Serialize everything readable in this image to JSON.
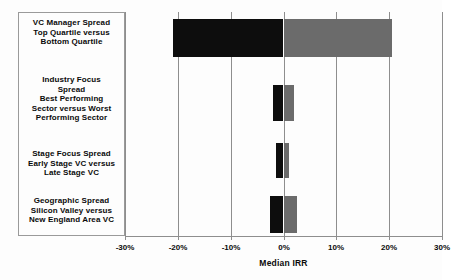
{
  "chart_data": {
    "type": "bar",
    "orientation": "horizontal",
    "title": "",
    "xlabel": "Median IRR",
    "ylabel": "",
    "xlim": [
      -30,
      30
    ],
    "xticks": [
      -30,
      -20,
      -10,
      0,
      10,
      20,
      30
    ],
    "xtick_labels": [
      "-30%",
      "-20%",
      "-10%",
      "0%",
      "10%",
      "20%",
      "30%"
    ],
    "grid": true,
    "legend": false,
    "categories": [
      "VC Manager Spread Top Quartile versus Bottom Quartile",
      "Industry Focus Spread Best Performing Sector versus Worst Performing Sector",
      "Stage Focus Spread Early Stage VC versus Late Stage VC",
      "Geographic Spread Silicon Valley versus New England Area VC"
    ],
    "category_lines": [
      [
        "VC Manager Spread",
        "Top Quartile versus",
        "Bottom Quartile"
      ],
      [
        "Industry Focus",
        "Spread",
        "Best Performing",
        "Sector versus Worst",
        "Performing Sector"
      ],
      [
        "Stage Focus Spread",
        "Early Stage VC versus",
        "Late Stage VC"
      ],
      [
        "Geographic Spread",
        "Silicon Valley versus",
        "New England Area VC"
      ]
    ],
    "series": [
      {
        "name": "Negative (lower) end",
        "values": [
          -21.0,
          -2.0,
          -1.5,
          -2.5
        ]
      },
      {
        "name": "Positive (upper) end",
        "values": [
          20.5,
          2.0,
          1.0,
          2.5
        ]
      }
    ],
    "bars": [
      {
        "label": "VC Manager Spread",
        "low": -21.0,
        "high": 20.5,
        "top_px": 19,
        "height_px": 38
      },
      {
        "label": "Industry Focus Spread",
        "low": -2.0,
        "high": 2.0,
        "top_px": 85,
        "height_px": 36
      },
      {
        "label": "Stage Focus Spread",
        "low": -1.5,
        "high": 1.0,
        "top_px": 143,
        "height_px": 35
      },
      {
        "label": "Geographic Spread",
        "low": -2.5,
        "high": 2.5,
        "top_px": 196,
        "height_px": 37
      }
    ],
    "colors": {
      "negative": "#0d0d0d",
      "positive": "#6b6b6b",
      "gridline": "#8e8e8e",
      "text": "#0a0a0a",
      "background": "#fdfdfd"
    }
  },
  "axis": {
    "x_title": "Median IRR"
  }
}
